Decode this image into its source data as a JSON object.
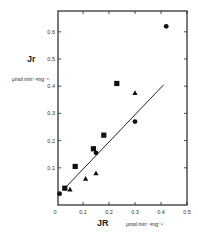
{
  "chart_data": {
    "type": "scatter",
    "title": "",
    "xlabel": "JR",
    "xlabel_unit": "μmol min⁻¹mg⁻¹",
    "ylabel": "Jr",
    "ylabel_unit": "μmol min⁻¹mg⁻¹",
    "xlim": [
      0,
      0.5
    ],
    "ylim": [
      0,
      0.68
    ],
    "xticks": [
      "0",
      "0.1",
      "0.2",
      "0.3",
      "0.4",
      "0.5"
    ],
    "yticks": [
      "0.1",
      "0.2",
      "0.3",
      "0.4",
      "0.5",
      "0.6"
    ],
    "grid": false,
    "legend": "none",
    "series": [
      {
        "name": "squares",
        "marker": "square",
        "points": [
          [
            0.03,
            0.025
          ],
          [
            0.07,
            0.105
          ],
          [
            0.14,
            0.17
          ],
          [
            0.18,
            0.22
          ],
          [
            0.23,
            0.41
          ]
        ]
      },
      {
        "name": "circles",
        "marker": "circle",
        "points": [
          [
            0.01,
            0.005
          ],
          [
            0.15,
            0.155
          ],
          [
            0.3,
            0.27
          ],
          [
            0.42,
            0.62
          ]
        ]
      },
      {
        "name": "triangles",
        "marker": "triangle",
        "points": [
          [
            0.05,
            0.02
          ],
          [
            0.11,
            0.06
          ],
          [
            0.15,
            0.08
          ],
          [
            0.3,
            0.375
          ]
        ]
      }
    ],
    "fit_line": {
      "x1": 0.03,
      "y1": 0.025,
      "x2": 0.41,
      "y2": 0.405
    }
  },
  "labels": {
    "y_title": "Jr",
    "y_unit": "μmol min⁻¹mg⁻¹",
    "x_title": "JR",
    "x_unit": "μmol min⁻¹mg⁻¹"
  }
}
